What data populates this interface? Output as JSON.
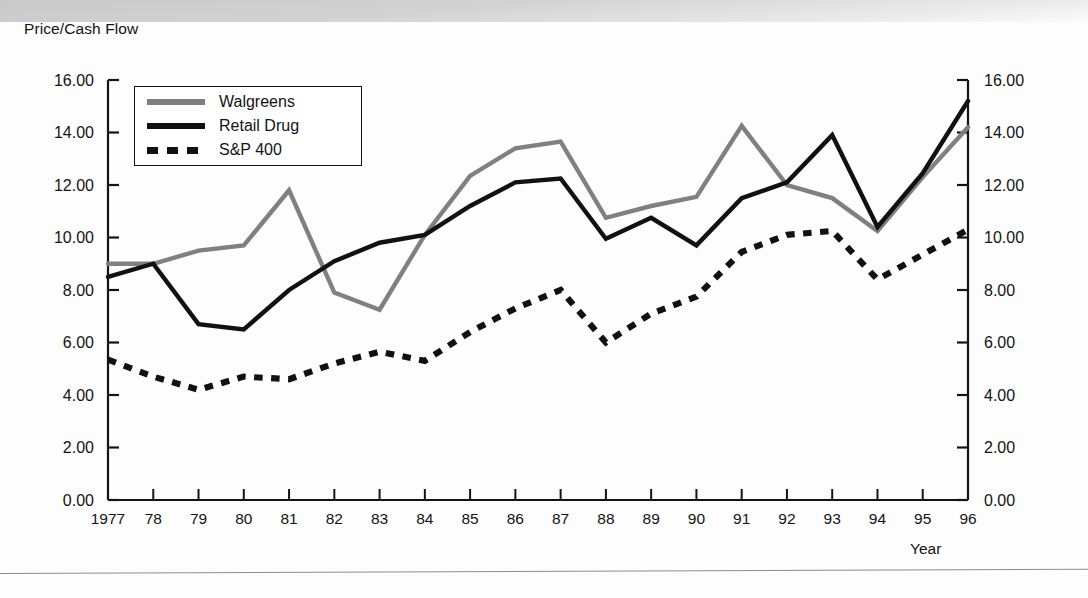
{
  "axis_title": "Price/Cash Flow",
  "x_axis_name": "Year",
  "legend": {
    "items": [
      {
        "label": "Walgreens",
        "style": "solid",
        "color": "#808080",
        "swatch": "walgreens-swatch"
      },
      {
        "label": "Retail Drug",
        "style": "solid",
        "color": "#111111",
        "swatch": "retail-drug-swatch"
      },
      {
        "label": "S&P 400",
        "style": "dotted",
        "color": "#111111",
        "swatch": "sp400-swatch"
      }
    ]
  },
  "y_ticks": [
    "16.00",
    "14.00",
    "12.00",
    "10.00",
    "8.00",
    "6.00",
    "4.00",
    "2.00",
    "0.00"
  ],
  "x_ticks": [
    "1977",
    "78",
    "79",
    "80",
    "81",
    "82",
    "83",
    "84",
    "85",
    "86",
    "87",
    "88",
    "89",
    "90",
    "91",
    "92",
    "93",
    "94",
    "95",
    "96"
  ],
  "chart_data": {
    "type": "line",
    "title": "",
    "xlabel": "Year",
    "ylabel": "Price/Cash Flow",
    "ylim": [
      0,
      16
    ],
    "ytick_step": 2,
    "grid": false,
    "legend_position": "top-left-inside",
    "x": [
      1977,
      1978,
      1979,
      1980,
      1981,
      1982,
      1983,
      1984,
      1985,
      1986,
      1987,
      1988,
      1989,
      1990,
      1991,
      1992,
      1993,
      1994,
      1995,
      1996
    ],
    "categories": [
      "1977",
      "78",
      "79",
      "80",
      "81",
      "82",
      "83",
      "84",
      "85",
      "86",
      "87",
      "88",
      "89",
      "90",
      "91",
      "92",
      "93",
      "94",
      "95",
      "96"
    ],
    "series": [
      {
        "name": "Walgreens",
        "color": "#808080",
        "style": "solid",
        "values": [
          9.0,
          9.0,
          9.5,
          9.7,
          11.8,
          7.9,
          7.25,
          10.1,
          12.35,
          13.4,
          13.65,
          10.75,
          11.2,
          11.55,
          14.25,
          12.0,
          11.5,
          10.25,
          12.3,
          14.2
        ]
      },
      {
        "name": "Retail Drug",
        "color": "#111111",
        "style": "solid",
        "values": [
          8.5,
          9.0,
          6.7,
          6.5,
          8.0,
          9.1,
          9.8,
          10.1,
          11.2,
          12.1,
          12.25,
          9.95,
          10.75,
          9.7,
          11.5,
          12.1,
          13.9,
          10.4,
          12.45,
          15.2
        ]
      },
      {
        "name": "S&P 400",
        "color": "#111111",
        "style": "dotted",
        "values": [
          5.35,
          4.7,
          4.2,
          4.7,
          4.6,
          5.2,
          5.65,
          5.3,
          6.4,
          7.3,
          8.0,
          6.0,
          7.1,
          7.75,
          9.45,
          10.1,
          10.25,
          8.4,
          9.35,
          10.3
        ]
      }
    ]
  }
}
